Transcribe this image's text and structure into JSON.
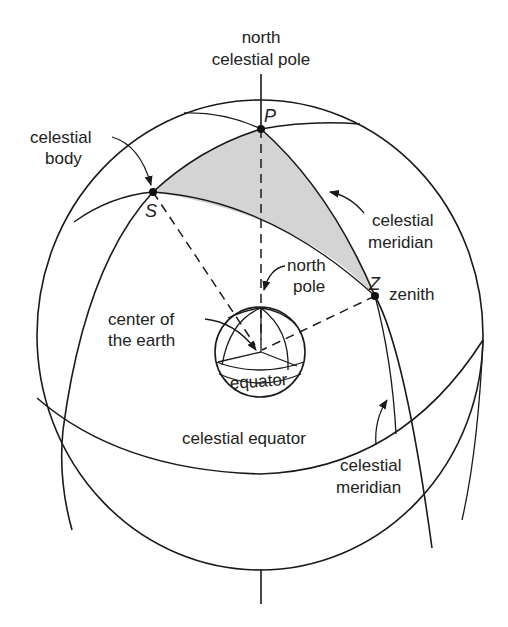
{
  "colors": {
    "line": "#1a1a1a",
    "shaded_triangle": "#d4d4d4",
    "background": "#ffffff",
    "text": "#222222"
  },
  "labels": {
    "north_celestial_pole_line1": "north",
    "north_celestial_pole_line2": "celestial pole",
    "celestial_body_line1": "celestial",
    "celestial_body_line2": "body",
    "celestial_meridian_upper_line1": "celestial",
    "celestial_meridian_upper_line2": "meridian",
    "north_pole_line1": "north",
    "north_pole_line2": "pole",
    "zenith": "zenith",
    "center_of_earth_line1": "center of",
    "center_of_earth_line2": "the earth",
    "equator": "equator",
    "celestial_equator": "celestial equator",
    "celestial_meridian_lower_line1": "celestial",
    "celestial_meridian_lower_line2": "meridian"
  },
  "points": {
    "P": "P",
    "S": "S",
    "Z": "Z"
  }
}
